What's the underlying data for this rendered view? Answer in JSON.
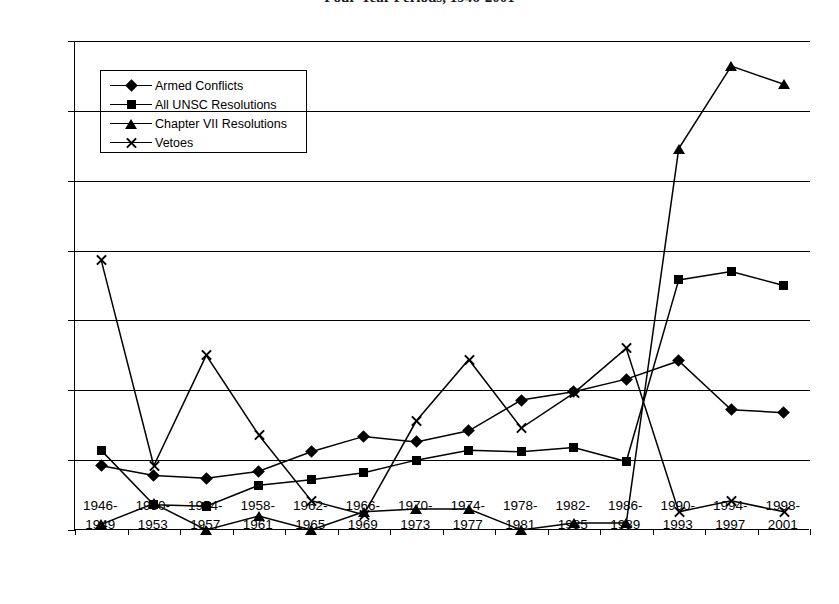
{
  "chart_data": {
    "type": "line",
    "title": "Four-Year Periods, 1946-2001",
    "xlabel": "",
    "ylabel": "",
    "ylim": [
      0,
      0.35
    ],
    "grid": true,
    "legend_position": "upper-left-inside",
    "y_ticks": [
      "0",
      "0.05",
      "0.1",
      "0.15",
      "0.2",
      "0.25",
      "0.3",
      "0.35"
    ],
    "y_tick_values": [
      0,
      0.05,
      0.1,
      0.15,
      0.2,
      0.25,
      0.3,
      0.35
    ],
    "categories": [
      "1946-\n1949",
      "1950-\n1953",
      "1954-\n1957",
      "1958-\n1961",
      "1962-\n1965",
      "1966-\n1969",
      "1970-\n1973",
      "1974-\n1977",
      "1978-\n1981",
      "1982-\n1985",
      "1986-\n1989",
      "1990-\n1993",
      "1994-\n1997",
      "1998-\n2001"
    ],
    "category_lines": [
      [
        "1946-",
        "1949"
      ],
      [
        "1950-",
        "1953"
      ],
      [
        "1954-",
        "1957"
      ],
      [
        "1958-",
        "1961"
      ],
      [
        "1962-",
        "1965"
      ],
      [
        "1966-",
        "1969"
      ],
      [
        "1970-",
        "1973"
      ],
      [
        "1974-",
        "1977"
      ],
      [
        "1978-",
        "1981"
      ],
      [
        "1982-",
        "1985"
      ],
      [
        "1986-",
        "1989"
      ],
      [
        "1990-",
        "1993"
      ],
      [
        "1994-",
        "1997"
      ],
      [
        "1998-",
        "2001"
      ]
    ],
    "series": [
      {
        "name": "Armed Conflicts",
        "marker": "diamond",
        "color": "#000000",
        "values": [
          0.046,
          0.039,
          0.037,
          0.042,
          0.056,
          0.067,
          0.063,
          0.071,
          0.093,
          0.099,
          0.108,
          0.121,
          0.086,
          0.084
        ]
      },
      {
        "name": "All UNSC Resolutions",
        "marker": "square",
        "color": "#000000",
        "values": [
          0.057,
          0.018,
          0.017,
          0.032,
          0.036,
          0.041,
          0.05,
          0.057,
          0.056,
          0.059,
          0.049,
          0.179,
          0.185,
          0.175
        ]
      },
      {
        "name": "Chapter VII Resolutions",
        "marker": "triangle",
        "color": "#000000",
        "values": [
          0.004,
          0.019,
          0.0,
          0.01,
          0.0,
          0.013,
          0.015,
          0.015,
          0.0,
          0.005,
          0.005,
          0.273,
          0.332,
          0.319
        ]
      },
      {
        "name": "Vetoes",
        "marker": "x",
        "color": "#000000",
        "values": [
          0.193,
          0.046,
          0.125,
          0.068,
          0.021,
          0.011,
          0.078,
          0.122,
          0.073,
          0.098,
          0.13,
          0.013,
          0.021,
          0.013
        ]
      }
    ]
  }
}
